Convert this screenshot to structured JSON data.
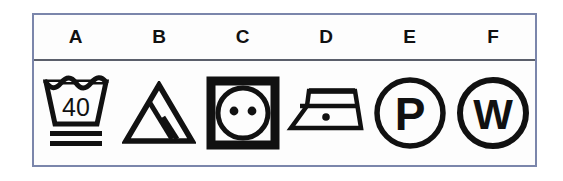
{
  "table": {
    "border_color": "#7b86ab",
    "header_rule_color": "#5b5f6b",
    "ink_color": "#111111",
    "background_color": "#fdfdfd",
    "columns": [
      {
        "letter": "A",
        "icon_name": "wash-tub-40-icon",
        "meaning": "Machine wash at 40 degrees, gentle cycle",
        "temperature_label": "40",
        "bars": 2
      },
      {
        "letter": "B",
        "icon_name": "bleach-triangle-lines-icon",
        "meaning": "Non-chlorine bleach only",
        "temperature_label": "",
        "bars": 0
      },
      {
        "letter": "C",
        "icon_name": "tumble-dry-two-dots-icon",
        "meaning": "Tumble dry, normal heat",
        "temperature_label": "",
        "dots": 2
      },
      {
        "letter": "D",
        "icon_name": "iron-one-dot-icon",
        "meaning": "Iron at low temperature",
        "temperature_label": "",
        "dots": 1
      },
      {
        "letter": "E",
        "icon_name": "dry-clean-p-icon",
        "meaning": "Professional dry clean, P solvents",
        "temperature_label": "P"
      },
      {
        "letter": "F",
        "icon_name": "wet-clean-w-icon",
        "meaning": "Professional wet cleaning",
        "temperature_label": "W"
      }
    ]
  }
}
